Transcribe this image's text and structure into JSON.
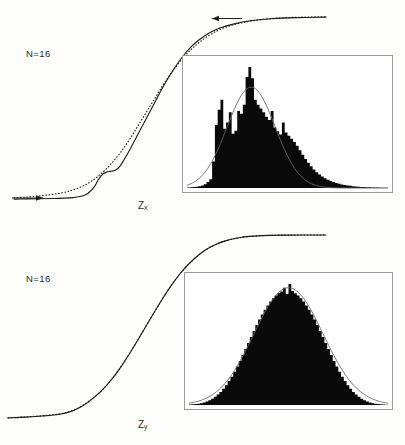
{
  "figure": {
    "background_color": "#fdfdfc",
    "ink_color": "#0a0a0a",
    "curve_color": "#666666",
    "box_border_color": "#9a9a9a"
  },
  "panels": [
    {
      "id": "panel-top",
      "n_label": "N=16",
      "axis_label_base": "Z",
      "axis_label_sub": "x",
      "curves": [
        "empirical-solid",
        "theoretical-dotted"
      ],
      "arrows": [
        "left-asymptote-arrow-right",
        "upper-asymptote-arrow-left"
      ],
      "inset_caption": "skewed histogram with normal overlay"
    },
    {
      "id": "panel-bottom",
      "n_label": "N=16",
      "axis_label_base": "Z",
      "axis_label_sub": "y",
      "curves": [
        "empirical-solid",
        "theoretical-dotted"
      ],
      "arrows": [],
      "inset_caption": "symmetric histogram with normal overlay"
    }
  ],
  "chart_data": [
    {
      "type": "line",
      "id": "cdf-zx",
      "title": "Cumulative distribution of Z_x",
      "xlabel": "Z_x",
      "ylabel": "",
      "xlim": [
        -3.2,
        4.2
      ],
      "ylim": [
        0,
        1
      ],
      "grid": false,
      "legend": "none",
      "annotations": [
        "N=16"
      ],
      "series": [
        {
          "name": "empirical-solid",
          "style": "solid",
          "x": [
            -3.2,
            -2.9,
            -2.6,
            -2.3,
            -2.0,
            -1.8,
            -1.6,
            -1.45,
            -1.3,
            -1.2,
            -1.1,
            -1.0,
            -0.9,
            -0.8,
            -0.7,
            -0.6,
            -0.45,
            -0.3,
            -0.15,
            0.0,
            0.15,
            0.3,
            0.45,
            0.6,
            0.8,
            1.0,
            1.2,
            1.45,
            1.7,
            2.0,
            2.4,
            2.9,
            3.5,
            4.2
          ],
          "y": [
            0.005,
            0.006,
            0.007,
            0.008,
            0.01,
            0.013,
            0.02,
            0.035,
            0.07,
            0.11,
            0.14,
            0.152,
            0.156,
            0.162,
            0.18,
            0.215,
            0.275,
            0.34,
            0.405,
            0.47,
            0.535,
            0.6,
            0.66,
            0.715,
            0.78,
            0.832,
            0.872,
            0.91,
            0.936,
            0.956,
            0.974,
            0.985,
            0.991,
            0.994
          ]
        },
        {
          "name": "theoretical-dotted",
          "style": "dotted",
          "x": [
            -3.2,
            -2.9,
            -2.6,
            -2.3,
            -2.0,
            -1.8,
            -1.6,
            -1.45,
            -1.3,
            -1.2,
            -1.1,
            -1.0,
            -0.9,
            -0.8,
            -0.7,
            -0.6,
            -0.45,
            -0.3,
            -0.15,
            0.0,
            0.15,
            0.3,
            0.45,
            0.6,
            0.8,
            1.0,
            1.2,
            1.45,
            1.7,
            2.0,
            2.4,
            2.9,
            3.5,
            4.2
          ],
          "y": [
            0.012,
            0.016,
            0.022,
            0.03,
            0.042,
            0.055,
            0.072,
            0.09,
            0.112,
            0.13,
            0.15,
            0.172,
            0.196,
            0.222,
            0.25,
            0.282,
            0.332,
            0.388,
            0.444,
            0.5,
            0.556,
            0.612,
            0.664,
            0.712,
            0.77,
            0.818,
            0.858,
            0.898,
            0.928,
            0.952,
            0.972,
            0.986,
            0.993,
            0.996
          ]
        }
      ]
    },
    {
      "type": "bar",
      "id": "hist-zx",
      "title": "Histogram of Z_x with normal overlay",
      "xlabel": "",
      "ylabel": "",
      "shape": "right-skewed, multi-modal spiky",
      "ylim": [
        0,
        1
      ],
      "bin_heights": [
        0.005,
        0.006,
        0.008,
        0.01,
        0.014,
        0.02,
        0.03,
        0.048,
        0.07,
        0.21,
        0.5,
        0.62,
        0.7,
        0.47,
        0.52,
        0.6,
        0.43,
        0.455,
        0.61,
        0.59,
        0.66,
        0.88,
        0.96,
        0.87,
        0.7,
        0.66,
        0.63,
        0.6,
        0.565,
        0.54,
        0.61,
        0.48,
        0.45,
        0.425,
        0.52,
        0.44,
        0.415,
        0.39,
        0.365,
        0.335,
        0.3,
        0.265,
        0.23,
        0.2,
        0.172,
        0.148,
        0.126,
        0.108,
        0.092,
        0.078,
        0.066,
        0.056,
        0.048,
        0.04,
        0.034,
        0.029,
        0.025,
        0.021,
        0.018,
        0.015,
        0.013,
        0.011,
        0.009,
        0.008,
        0.007,
        0.006,
        0.005,
        0.004,
        0.004,
        0.003,
        0.003,
        0.002
      ],
      "overlay_curve": {
        "name": "normal-fit",
        "mean_bin": 23.0,
        "sigma_bins": 8.6,
        "peak": 0.8
      }
    },
    {
      "type": "line",
      "id": "cdf-zy",
      "title": "Cumulative distribution of Z_y",
      "xlabel": "Z_y",
      "ylabel": "",
      "xlim": [
        -3.2,
        4.2
      ],
      "ylim": [
        0,
        1
      ],
      "grid": false,
      "legend": "none",
      "annotations": [
        "N=16"
      ],
      "series": [
        {
          "name": "empirical-solid",
          "style": "solid",
          "x": [
            -3.2,
            -2.8,
            -2.4,
            -2.0,
            -1.7,
            -1.45,
            -1.2,
            -1.0,
            -0.8,
            -0.6,
            -0.4,
            -0.2,
            0.0,
            0.2,
            0.4,
            0.6,
            0.8,
            1.0,
            1.25,
            1.5,
            1.8,
            2.2,
            2.7,
            3.3,
            4.2
          ],
          "y": [
            0.006,
            0.01,
            0.016,
            0.026,
            0.044,
            0.073,
            0.116,
            0.159,
            0.212,
            0.274,
            0.345,
            0.421,
            0.5,
            0.579,
            0.655,
            0.726,
            0.788,
            0.841,
            0.894,
            0.933,
            0.964,
            0.986,
            0.9965,
            0.9995,
            1.0
          ]
        },
        {
          "name": "theoretical-dotted",
          "style": "dotted",
          "x": [
            -3.2,
            -2.8,
            -2.4,
            -2.0,
            -1.7,
            -1.45,
            -1.2,
            -1.0,
            -0.8,
            -0.6,
            -0.4,
            -0.2,
            0.0,
            0.2,
            0.4,
            0.6,
            0.8,
            1.0,
            1.25,
            1.5,
            1.8,
            2.2,
            2.7,
            3.3,
            4.2
          ],
          "y": [
            0.007,
            0.011,
            0.018,
            0.028,
            0.046,
            0.075,
            0.118,
            0.159,
            0.212,
            0.274,
            0.345,
            0.421,
            0.5,
            0.579,
            0.655,
            0.726,
            0.788,
            0.841,
            0.894,
            0.933,
            0.964,
            0.986,
            0.9965,
            0.9995,
            1.0
          ]
        }
      ]
    },
    {
      "type": "bar",
      "id": "hist-zy",
      "title": "Histogram of Z_y with normal overlay",
      "xlabel": "",
      "ylabel": "",
      "shape": "symmetric bell-shaped",
      "ylim": [
        0,
        1
      ],
      "bin_heights": [
        0.004,
        0.006,
        0.008,
        0.011,
        0.015,
        0.021,
        0.028,
        0.038,
        0.05,
        0.065,
        0.083,
        0.104,
        0.129,
        0.158,
        0.19,
        0.225,
        0.264,
        0.306,
        0.35,
        0.396,
        0.444,
        0.492,
        0.54,
        0.588,
        0.634,
        0.678,
        0.718,
        0.756,
        0.79,
        0.82,
        0.846,
        0.868,
        0.886,
        0.9,
        0.93,
        0.88,
        0.96,
        0.905,
        0.886,
        0.868,
        0.846,
        0.82,
        0.79,
        0.756,
        0.718,
        0.678,
        0.634,
        0.588,
        0.54,
        0.492,
        0.444,
        0.396,
        0.35,
        0.306,
        0.264,
        0.225,
        0.19,
        0.158,
        0.129,
        0.104,
        0.083,
        0.065,
        0.05,
        0.038,
        0.028,
        0.021,
        0.015,
        0.011,
        0.008,
        0.006,
        0.004,
        0.003
      ],
      "overlay_curve": {
        "name": "normal-fit",
        "mean_bin": 36.0,
        "sigma_bins": 12.5,
        "peak": 0.93
      }
    }
  ]
}
